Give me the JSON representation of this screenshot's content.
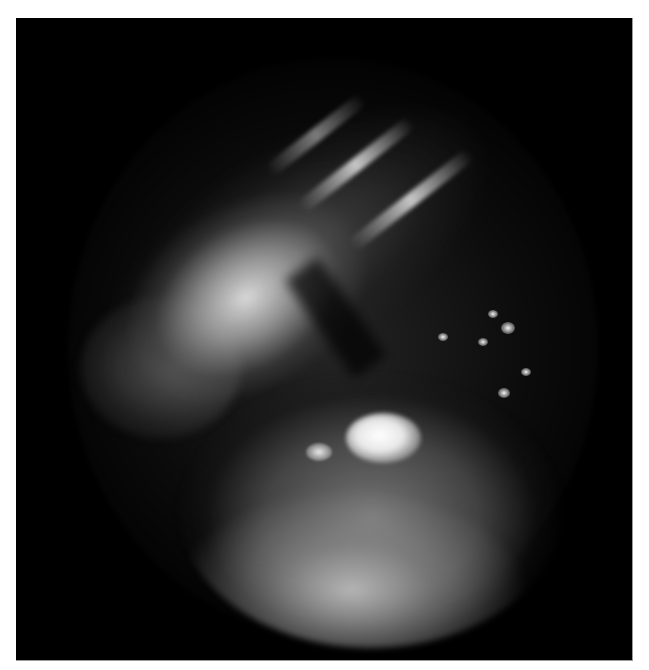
{
  "image": {
    "type": "grayscale endoscopic photograph",
    "background_color": "#ffffff",
    "frame_color": "#000000",
    "regions": [
      {
        "name": "upper-tissue-band",
        "description": "bright vascular tissue running diagonally across upper-left"
      },
      {
        "name": "lower-mass",
        "description": "rounded mottled mass in lower center with bright central highlight"
      },
      {
        "name": "specular-highlights",
        "description": "small bright reflection spots on right side"
      }
    ]
  }
}
